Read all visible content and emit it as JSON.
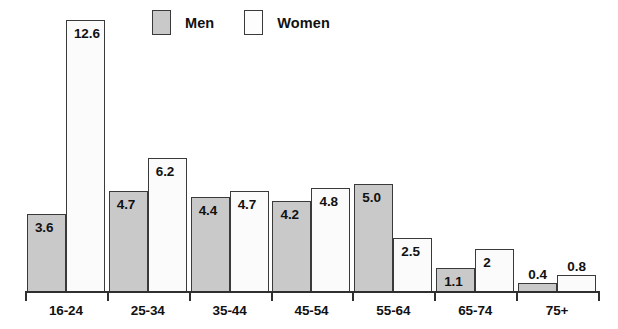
{
  "legend": {
    "items": [
      {
        "label": "Men",
        "key": "men",
        "color": "#c9c9c9"
      },
      {
        "label": "Women",
        "key": "women",
        "color": "#fbfbfb"
      }
    ]
  },
  "axis": {
    "baseline_color": "#2f2f2f",
    "tick_count": 8
  },
  "style": {
    "men_fill": "#c9c9c9",
    "women_fill": "#fbfbfb",
    "border": "#3a3a3a",
    "text": "#111111",
    "background": "#ffffff"
  },
  "chart_data": {
    "type": "bar",
    "title": "",
    "subtitle": "",
    "xlabel": "",
    "ylabel": "",
    "grid": false,
    "legend_position": "top-left",
    "axis_visible": "x-only",
    "ylim": [
      0,
      13.5
    ],
    "categories": [
      "16-24",
      "25-34",
      "35-44",
      "45-54",
      "55-64",
      "65-74",
      "75+"
    ],
    "series": [
      {
        "name": "Men",
        "color": "#c9c9c9",
        "values": [
          3.6,
          4.7,
          4.4,
          4.2,
          5.0,
          1.1,
          0.4
        ],
        "labels": [
          "3.6",
          "4.7",
          "4.4",
          "4.2",
          "5.0",
          "1.1",
          "0.4"
        ],
        "label_placement": [
          "inside",
          "inside",
          "inside",
          "inside",
          "inside",
          "inside",
          "above"
        ]
      },
      {
        "name": "Women",
        "color": "#fbfbfb",
        "values": [
          12.6,
          6.2,
          4.7,
          4.8,
          2.5,
          2,
          0.8
        ],
        "labels": [
          "12.6",
          "6.2",
          "4.7",
          "4.8",
          "2.5",
          "2",
          "0.8"
        ],
        "label_placement": [
          "inside",
          "inside",
          "inside",
          "inside",
          "inside",
          "inside",
          "above"
        ]
      }
    ]
  }
}
